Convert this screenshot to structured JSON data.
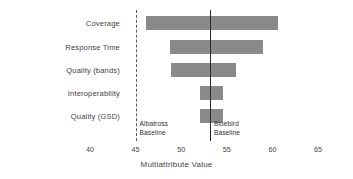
{
  "chart_data": {
    "type": "bar",
    "chart_style": "tornado",
    "title": "",
    "xlabel": "Multiattribute Value",
    "ylabel": "",
    "xlim": [
      40,
      65
    ],
    "xticks": [
      40,
      45,
      50,
      55,
      60,
      65
    ],
    "xtick_labels": [
      "40",
      "45",
      "50",
      "55",
      "60",
      "65"
    ],
    "grid": false,
    "legend": "none",
    "categories": [
      "Coverage",
      "Response Time",
      "Quality (bands)",
      "Interoperability",
      "Quality (GSD)"
    ],
    "bars": [
      {
        "category": "Coverage",
        "low": 46.1,
        "high": 60.6
      },
      {
        "category": "Response Time",
        "low": 48.8,
        "high": 59.0
      },
      {
        "category": "Quality (bands)",
        "low": 48.9,
        "high": 56.0
      },
      {
        "category": "Interoperability",
        "low": 52.1,
        "high": 54.6
      },
      {
        "category": "Quality (GSD)",
        "low": 52.1,
        "high": 54.6
      }
    ],
    "reference_lines": [
      {
        "name": "Albatross Baseline",
        "value": 45.0,
        "style": "dashed",
        "label_line1": "Albatross",
        "label_line2": "Baseline"
      },
      {
        "name": "Bluebird Baseline",
        "value": 53.15,
        "style": "solid",
        "label_line1": "Bluebird",
        "label_line2": "Baseline"
      }
    ],
    "colors": {
      "bar": "#8a8a8a",
      "dashed_line": "#5a5a5a",
      "solid_line": "#2b2b2b",
      "text": "#3f3f3f",
      "background": "#ffffff"
    }
  }
}
